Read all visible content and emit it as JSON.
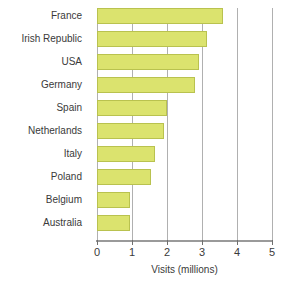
{
  "chart_data": {
    "type": "bar",
    "orientation": "horizontal",
    "title": "",
    "xlabel": "Visits (millions)",
    "ylabel": "",
    "xlim": [
      0,
      5
    ],
    "xticks": [
      "0",
      "1",
      "2",
      "3",
      "4",
      "5"
    ],
    "grid": "vertical",
    "legend": "none",
    "bar_color": "#dbe36e",
    "bar_border_color": "#b9c24f",
    "categories": [
      "France",
      "Irish Republic",
      "USA",
      "Germany",
      "Spain",
      "Netherlands",
      "Italy",
      "Poland",
      "Belgium",
      "Australia"
    ],
    "values": [
      3.6,
      3.15,
      2.9,
      2.8,
      2.0,
      1.9,
      1.65,
      1.55,
      0.95,
      0.95
    ]
  }
}
